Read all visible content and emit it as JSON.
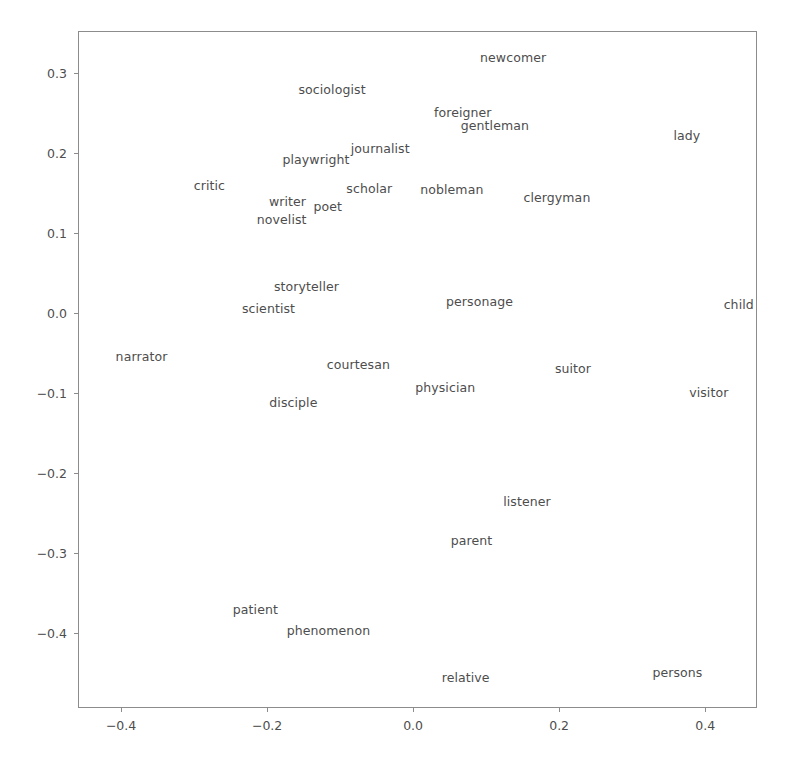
{
  "figure": {
    "background_color": "#ffffff",
    "text_color": "#4d4d4d",
    "spine_color": "#8c8c8c",
    "title": "",
    "caption": ""
  },
  "chart_data": {
    "type": "scatter",
    "title": "",
    "subtitle": "",
    "xlabel": "",
    "ylabel": "",
    "xlim": [
      -0.459,
      0.471
    ],
    "ylim": [
      -0.494,
      0.353
    ],
    "grid": false,
    "legend": null,
    "legend_position": "none",
    "marker": "text-label-only",
    "xticks": [
      -0.4,
      -0.2,
      0.0,
      0.2,
      0.4
    ],
    "xticklabels": [
      "−0.4",
      "−0.2",
      "0.0",
      "0.2",
      "0.4"
    ],
    "yticks": [
      -0.4,
      -0.3,
      -0.2,
      -0.1,
      0.0,
      0.1,
      0.2,
      0.3
    ],
    "yticklabels": [
      "−0.4",
      "−0.3",
      "−0.2",
      "−0.1",
      "0.0",
      "0.1",
      "0.2",
      "0.3"
    ],
    "point_count": 32,
    "points": [
      {
        "label": "newcomer",
        "x": 0.137,
        "y": 0.319
      },
      {
        "label": "sociologist",
        "x": -0.111,
        "y": 0.279
      },
      {
        "label": "foreigner",
        "x": 0.068,
        "y": 0.25
      },
      {
        "label": "gentleman",
        "x": 0.112,
        "y": 0.234
      },
      {
        "label": "lady",
        "x": 0.375,
        "y": 0.222
      },
      {
        "label": "journalist",
        "x": -0.045,
        "y": 0.205
      },
      {
        "label": "playwright",
        "x": -0.133,
        "y": 0.191
      },
      {
        "label": "critic",
        "x": -0.279,
        "y": 0.159
      },
      {
        "label": "scholar",
        "x": -0.06,
        "y": 0.155
      },
      {
        "label": "nobleman",
        "x": 0.053,
        "y": 0.154
      },
      {
        "label": "clergyman",
        "x": 0.197,
        "y": 0.144
      },
      {
        "label": "writer",
        "x": -0.172,
        "y": 0.139
      },
      {
        "label": "poet",
        "x": -0.117,
        "y": 0.133
      },
      {
        "label": "novelist",
        "x": -0.18,
        "y": 0.117
      },
      {
        "label": "storyteller",
        "x": -0.146,
        "y": 0.033
      },
      {
        "label": "personage",
        "x": 0.091,
        "y": 0.014
      },
      {
        "label": "child",
        "x": 0.446,
        "y": 0.01
      },
      {
        "label": "scientist",
        "x": -0.198,
        "y": 0.005
      },
      {
        "label": "narrator",
        "x": -0.372,
        "y": -0.055
      },
      {
        "label": "courtesan",
        "x": -0.075,
        "y": -0.065
      },
      {
        "label": "suitor",
        "x": 0.219,
        "y": -0.07
      },
      {
        "label": "physician",
        "x": 0.044,
        "y": -0.094
      },
      {
        "label": "visitor",
        "x": 0.405,
        "y": -0.1
      },
      {
        "label": "disciple",
        "x": -0.164,
        "y": -0.112
      },
      {
        "label": "listener",
        "x": 0.156,
        "y": -0.236
      },
      {
        "label": "parent",
        "x": 0.08,
        "y": -0.285
      },
      {
        "label": "patient",
        "x": -0.216,
        "y": -0.372
      },
      {
        "label": "phenomenon",
        "x": -0.116,
        "y": -0.398
      },
      {
        "label": "relative",
        "x": 0.072,
        "y": -0.456
      },
      {
        "label": "persons",
        "x": 0.362,
        "y": -0.45
      }
    ]
  }
}
